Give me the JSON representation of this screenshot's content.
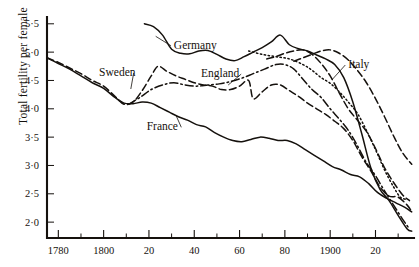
{
  "chart_data": {
    "type": "line",
    "title": "",
    "xlabel": "",
    "ylabel": "Total fertility per female",
    "xlim": [
      1775,
      1937
    ],
    "ylim": [
      1.72,
      5.62
    ],
    "grid": false,
    "legend_position": "inline-labels",
    "x_major_ticks": [
      1780,
      1800,
      1820,
      1840,
      1860,
      1880,
      1900,
      1920
    ],
    "x_major_tick_labels": [
      "1780",
      "1800",
      "20",
      "40",
      "60",
      "80",
      "1900",
      "20"
    ],
    "x_minor_ticks": [
      1790,
      1810,
      1830,
      1850,
      1870,
      1890,
      1910,
      1930
    ],
    "y_ticks": [
      2.0,
      2.5,
      3.0,
      3.5,
      4.0,
      4.5,
      5.0,
      5.5
    ],
    "y_tick_labels": [
      "2·0",
      "2·5",
      "3·0",
      "3·5",
      "4·0",
      "4·5",
      "5·0",
      "5·5"
    ],
    "series": [
      {
        "name": "Germany",
        "style": "solid",
        "label": "Germany",
        "label_x": 1831,
        "label_y": 5.06,
        "leader_to_x": 1823,
        "leader_to_y": 5.28,
        "points": [
          [
            1818,
            5.5
          ],
          [
            1822,
            5.45
          ],
          [
            1826,
            5.3
          ],
          [
            1830,
            5.05
          ],
          [
            1834,
            4.98
          ],
          [
            1838,
            4.97
          ],
          [
            1842,
            5.02
          ],
          [
            1846,
            5.03
          ],
          [
            1850,
            4.96
          ],
          [
            1854,
            4.88
          ],
          [
            1858,
            4.85
          ],
          [
            1862,
            4.92
          ],
          [
            1866,
            5.0
          ],
          [
            1870,
            5.08
          ],
          [
            1874,
            5.18
          ],
          [
            1878,
            5.3
          ],
          [
            1882,
            5.13
          ],
          [
            1886,
            5.06
          ],
          [
            1890,
            5.02
          ],
          [
            1894,
            4.95
          ],
          [
            1898,
            4.88
          ],
          [
            1902,
            4.78
          ],
          [
            1906,
            4.55
          ],
          [
            1910,
            4.12
          ],
          [
            1914,
            3.55
          ],
          [
            1918,
            2.95
          ],
          [
            1922,
            2.58
          ],
          [
            1926,
            2.38
          ],
          [
            1930,
            2.12
          ],
          [
            1934,
            1.88
          ],
          [
            1936,
            1.84
          ]
        ]
      },
      {
        "name": "Sweden",
        "style": "dashed",
        "label": "Sweden",
        "label_x": 1798,
        "label_y": 4.58,
        "leader_to_x": 1812,
        "leader_to_y": 4.35,
        "points": [
          [
            1775,
            4.9
          ],
          [
            1780,
            4.82
          ],
          [
            1785,
            4.72
          ],
          [
            1790,
            4.62
          ],
          [
            1795,
            4.5
          ],
          [
            1800,
            4.4
          ],
          [
            1805,
            4.22
          ],
          [
            1809,
            4.08
          ],
          [
            1813,
            4.12
          ],
          [
            1817,
            4.32
          ],
          [
            1821,
            4.58
          ],
          [
            1824,
            4.75
          ],
          [
            1828,
            4.66
          ],
          [
            1832,
            4.58
          ],
          [
            1836,
            4.52
          ],
          [
            1840,
            4.46
          ],
          [
            1844,
            4.42
          ],
          [
            1848,
            4.4
          ],
          [
            1852,
            4.34
          ],
          [
            1856,
            4.34
          ],
          [
            1860,
            4.4
          ],
          [
            1864,
            4.5
          ],
          [
            1866,
            4.18
          ],
          [
            1870,
            4.3
          ],
          [
            1874,
            4.42
          ],
          [
            1878,
            4.42
          ],
          [
            1882,
            4.32
          ],
          [
            1886,
            4.22
          ],
          [
            1890,
            4.1
          ],
          [
            1894,
            4.0
          ],
          [
            1898,
            3.9
          ],
          [
            1902,
            3.78
          ],
          [
            1906,
            3.65
          ],
          [
            1910,
            3.44
          ],
          [
            1914,
            3.15
          ],
          [
            1918,
            2.9
          ],
          [
            1922,
            2.62
          ],
          [
            1926,
            2.46
          ],
          [
            1930,
            2.44
          ],
          [
            1934,
            2.3
          ],
          [
            1936,
            2.18
          ]
        ]
      },
      {
        "name": "England",
        "style": "dashdot",
        "label": "England",
        "label_x": 1843,
        "label_y": 4.56,
        "leader_to_x": 1855,
        "leader_to_y": 4.42,
        "points": [
          [
            1811,
            4.08
          ],
          [
            1816,
            4.2
          ],
          [
            1821,
            4.34
          ],
          [
            1826,
            4.42
          ],
          [
            1831,
            4.46
          ],
          [
            1836,
            4.42
          ],
          [
            1841,
            4.4
          ],
          [
            1846,
            4.42
          ],
          [
            1851,
            4.44
          ],
          [
            1856,
            4.48
          ],
          [
            1861,
            4.54
          ],
          [
            1866,
            4.62
          ],
          [
            1871,
            4.7
          ],
          [
            1876,
            4.78
          ],
          [
            1880,
            4.78
          ],
          [
            1884,
            4.7
          ],
          [
            1888,
            4.52
          ],
          [
            1892,
            4.34
          ],
          [
            1896,
            4.2
          ],
          [
            1900,
            4.0
          ],
          [
            1904,
            3.82
          ],
          [
            1908,
            3.62
          ],
          [
            1912,
            3.35
          ],
          [
            1916,
            3.05
          ],
          [
            1920,
            2.82
          ],
          [
            1924,
            2.55
          ],
          [
            1928,
            2.3
          ],
          [
            1932,
            2.05
          ],
          [
            1935,
            1.88
          ]
        ]
      },
      {
        "name": "Italy",
        "style": "dotted",
        "label": "Italy",
        "label_x": 1908,
        "label_y": 4.72,
        "leader_to_x": 1901,
        "leader_to_y": 4.52,
        "points": [
          [
            1864,
            5.02
          ],
          [
            1870,
            4.96
          ],
          [
            1876,
            4.92
          ],
          [
            1882,
            4.88
          ],
          [
            1888,
            4.78
          ],
          [
            1892,
            4.68
          ],
          [
            1896,
            4.55
          ],
          [
            1900,
            4.45
          ],
          [
            1904,
            4.3
          ],
          [
            1908,
            4.12
          ],
          [
            1912,
            3.92
          ],
          [
            1916,
            3.62
          ],
          [
            1920,
            3.28
          ],
          [
            1924,
            2.92
          ],
          [
            1928,
            2.62
          ],
          [
            1931,
            2.44
          ],
          [
            1934,
            2.4
          ]
        ]
      },
      {
        "name": "France",
        "style": "solid",
        "label": "France",
        "label_x": 1819,
        "label_y": 3.62,
        "leader_to_x": 1832,
        "leader_to_y": 3.88,
        "points": [
          [
            1775,
            4.9
          ],
          [
            1780,
            4.8
          ],
          [
            1785,
            4.7
          ],
          [
            1790,
            4.58
          ],
          [
            1795,
            4.46
          ],
          [
            1800,
            4.36
          ],
          [
            1805,
            4.2
          ],
          [
            1809,
            4.1
          ],
          [
            1813,
            4.09
          ],
          [
            1817,
            4.12
          ],
          [
            1821,
            4.1
          ],
          [
            1825,
            4.02
          ],
          [
            1829,
            3.94
          ],
          [
            1833,
            3.86
          ],
          [
            1837,
            3.8
          ],
          [
            1841,
            3.72
          ],
          [
            1845,
            3.68
          ],
          [
            1849,
            3.58
          ],
          [
            1853,
            3.5
          ],
          [
            1857,
            3.44
          ],
          [
            1861,
            3.42
          ],
          [
            1865,
            3.46
          ],
          [
            1869,
            3.5
          ],
          [
            1873,
            3.48
          ],
          [
            1877,
            3.44
          ],
          [
            1881,
            3.44
          ],
          [
            1885,
            3.38
          ],
          [
            1889,
            3.28
          ],
          [
            1893,
            3.18
          ],
          [
            1897,
            3.08
          ],
          [
            1901,
            2.98
          ],
          [
            1905,
            2.92
          ],
          [
            1909,
            2.84
          ],
          [
            1913,
            2.8
          ],
          [
            1917,
            2.68
          ],
          [
            1921,
            2.52
          ],
          [
            1925,
            2.42
          ],
          [
            1929,
            2.34
          ],
          [
            1933,
            2.26
          ],
          [
            1936,
            2.18
          ]
        ]
      },
      {
        "name": "Germany-tail-dashed",
        "style": "dashed",
        "label": "",
        "points": [
          [
            1884,
            4.84
          ],
          [
            1888,
            4.9
          ],
          [
            1892,
            4.96
          ],
          [
            1896,
            5.02
          ],
          [
            1900,
            5.04
          ],
          [
            1904,
            4.98
          ],
          [
            1908,
            4.86
          ],
          [
            1912,
            4.68
          ],
          [
            1916,
            4.46
          ],
          [
            1920,
            4.18
          ],
          [
            1924,
            3.86
          ],
          [
            1928,
            3.52
          ],
          [
            1932,
            3.22
          ],
          [
            1936,
            3.02
          ]
        ]
      },
      {
        "name": "England-upper-dashed",
        "style": "dashed",
        "label": "",
        "points": [
          [
            1872,
            4.88
          ],
          [
            1876,
            4.92
          ],
          [
            1880,
            4.98
          ],
          [
            1884,
            5.02
          ],
          [
            1888,
            5.04
          ],
          [
            1892,
            4.96
          ],
          [
            1896,
            4.8
          ],
          [
            1900,
            4.58
          ],
          [
            1904,
            4.28
          ],
          [
            1908,
            4.0
          ],
          [
            1912,
            3.8
          ],
          [
            1916,
            3.6
          ],
          [
            1920,
            3.3
          ],
          [
            1924,
            2.96
          ],
          [
            1928,
            2.7
          ],
          [
            1932,
            2.48
          ],
          [
            1935,
            2.38
          ]
        ]
      }
    ]
  },
  "axis": {
    "y_axis_title": "Total fertility per female"
  }
}
